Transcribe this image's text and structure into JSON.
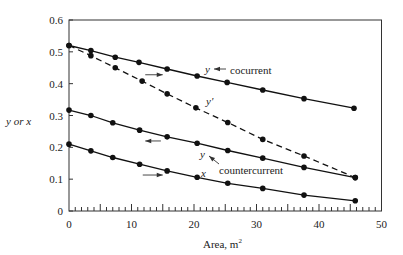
{
  "chart_data": {
    "type": "line",
    "title": "",
    "xlabel": "Area, m",
    "xlabel_superscript": "2",
    "ylabel": "y or x",
    "xlim": [
      0,
      50
    ],
    "ylim": [
      0,
      0.6
    ],
    "x_ticks": [
      0,
      10,
      20,
      30,
      40,
      50
    ],
    "x_tick_labels": [
      "0",
      "10",
      "20",
      "30",
      "40",
      "50"
    ],
    "x_minor_tick_step": 1,
    "y_ticks": [
      0,
      0.1,
      0.2,
      0.3,
      0.4,
      0.5,
      0.6
    ],
    "y_tick_labels": [
      "0",
      "0.1",
      "0.2",
      "0.3",
      "0.4",
      "0.5",
      "0.6"
    ],
    "grid": false,
    "legend": "none (inline annotations)",
    "series": [
      {
        "name": "y cocurrent",
        "style": "solid",
        "x": [
          0,
          3.5,
          7.4,
          11.2,
          15.7,
          20.5,
          25.3,
          31.0,
          37.6,
          45.6
        ],
        "y": [
          0.52,
          0.504,
          0.483,
          0.467,
          0.446,
          0.424,
          0.404,
          0.38,
          0.353,
          0.323
        ]
      },
      {
        "name": "y' (cocurrent)",
        "style": "dashed",
        "x": [
          0,
          3.5,
          7.4,
          11.7,
          15.7,
          20.3,
          25.4,
          31.0,
          37.6,
          45.8
        ],
        "y": [
          0.52,
          0.488,
          0.45,
          0.408,
          0.368,
          0.324,
          0.278,
          0.225,
          0.173,
          0.105
        ]
      },
      {
        "name": "y countercurrent",
        "style": "solid",
        "x": [
          0,
          3.5,
          7.0,
          11.3,
          15.7,
          20.5,
          25.4,
          31.0,
          37.6,
          45.8
        ],
        "y": [
          0.317,
          0.3,
          0.277,
          0.254,
          0.233,
          0.213,
          0.19,
          0.166,
          0.137,
          0.105
        ]
      },
      {
        "name": "x",
        "style": "solid",
        "x": [
          0,
          3.5,
          7.0,
          11.3,
          15.7,
          20.5,
          25.4,
          31.0,
          37.6,
          45.8
        ],
        "y": [
          0.21,
          0.189,
          0.168,
          0.147,
          0.126,
          0.106,
          0.087,
          0.071,
          0.05,
          0.032
        ]
      }
    ],
    "annotations": [
      {
        "text": "y",
        "italic": true,
        "x": 22.3,
        "y": 0.443,
        "note": "cocurrent label"
      },
      {
        "text": "cocurrent",
        "x": 26.3,
        "y": 0.435
      },
      {
        "text": "y'",
        "italic": true,
        "x": 22.3,
        "y": 0.34
      },
      {
        "text": "y",
        "italic": true,
        "x": 21.5,
        "y": 0.17,
        "note": "countercurrent label"
      },
      {
        "text": "countercurrent",
        "x": 24.3,
        "y": 0.12
      },
      {
        "text": "x",
        "italic": true,
        "x": 21.5,
        "y": 0.115
      },
      {
        "arrow": "right",
        "x1": 12.2,
        "x2": 15.0,
        "y": 0.428
      },
      {
        "arrow": "left",
        "x1": 14.7,
        "x2": 12.2,
        "y": 0.22
      },
      {
        "arrow": "right",
        "x1": 11.8,
        "x2": 15.0,
        "y": 0.113
      }
    ]
  },
  "labels": {
    "ylabel": "y or x",
    "xlabel": "Area, m",
    "xlabel_sup": "2",
    "cocurrent_y": "y",
    "cocurrent": "cocurrent",
    "yprime": "y'",
    "counter_y": "y",
    "countercurrent": "countercurrent",
    "x": "x"
  }
}
